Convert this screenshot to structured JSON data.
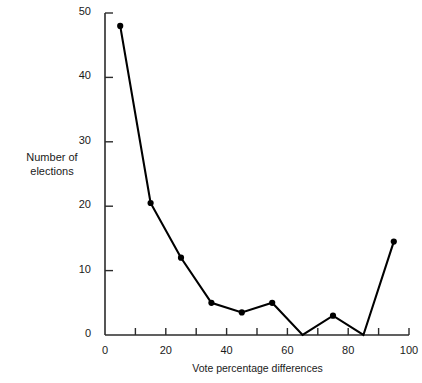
{
  "chart_data": {
    "type": "line",
    "title": "",
    "subtitle": "",
    "xlabel": "Vote percentage differences",
    "ylabel": "Number of\nelections",
    "ylabel_line1": "Number of",
    "ylabel_line2": "elections",
    "xlim": [
      0,
      100
    ],
    "ylim": [
      0,
      50
    ],
    "grid": false,
    "legend": false,
    "legend_position": "none",
    "markers": "filled-circle",
    "line_color": "#000000",
    "marker_color": "#000000",
    "axis_color": "#2b2b2b",
    "background_color": "#ffffff",
    "x_major_ticks": [
      0,
      20,
      40,
      60,
      80,
      100
    ],
    "x_minor_ticks": [
      10,
      30,
      50,
      70,
      90
    ],
    "x_tick_labels": [
      "0",
      "20",
      "40",
      "60",
      "80",
      "100"
    ],
    "y_major_ticks": [
      10,
      20,
      30,
      40,
      50
    ],
    "y_tick_labels": [
      "0",
      "10",
      "20",
      "30",
      "40",
      "50"
    ],
    "y_axis_label_values": [
      0,
      10,
      20,
      30,
      40,
      50
    ],
    "x": [
      5,
      15,
      25,
      35,
      45,
      55,
      65,
      75,
      85,
      95
    ],
    "values": [
      48,
      20.5,
      12,
      5,
      3.5,
      5,
      0,
      3,
      0,
      14.5
    ],
    "points": [
      {
        "x": 5,
        "y": 48
      },
      {
        "x": 15,
        "y": 20.5
      },
      {
        "x": 25,
        "y": 12
      },
      {
        "x": 35,
        "y": 5
      },
      {
        "x": 45,
        "y": 3.5
      },
      {
        "x": 55,
        "y": 5
      },
      {
        "x": 65,
        "y": 0
      },
      {
        "x": 75,
        "y": 3
      },
      {
        "x": 85,
        "y": 0
      },
      {
        "x": 95,
        "y": 14.5
      }
    ],
    "series": [
      {
        "name": "Number of elections",
        "x": [
          5,
          15,
          25,
          35,
          45,
          55,
          65,
          75,
          85,
          95
        ],
        "values": [
          48,
          20.5,
          12,
          5,
          3.5,
          5,
          0,
          3,
          0,
          14.5
        ]
      }
    ]
  }
}
